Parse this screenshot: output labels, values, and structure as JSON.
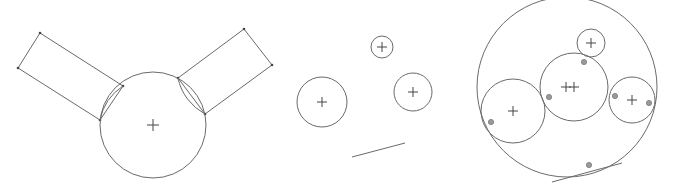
{
  "figure": {
    "width": 675,
    "height": 191,
    "background": "#ffffff",
    "stroke_color": "#6a6a6a",
    "marker_color": "#9a9a9a",
    "panels": [
      {
        "id": "panel-1",
        "description": "Circle with two attached rectangles",
        "circles": [
          {
            "cx": 153,
            "cy": 125,
            "r": 53,
            "center_cross": true
          }
        ],
        "polygons": [
          {
            "points": [
              [
                40,
                33
              ],
              [
                123,
                86
              ],
              [
                100,
                120
              ],
              [
                18,
                68
              ]
            ],
            "vertices_marked": true
          },
          {
            "points": [
              [
                244,
                29
              ],
              [
                272,
                65
              ],
              [
                205,
                114
              ],
              [
                178,
                78
              ]
            ],
            "vertices_marked": true
          }
        ],
        "arcs": [
          {
            "from": [
              123,
              86
            ],
            "to": [
              100,
              120
            ],
            "r": 53
          },
          {
            "from": [
              178,
              78
            ],
            "to": [
              205,
              114
            ],
            "r": 53
          }
        ]
      },
      {
        "id": "panel-2",
        "description": "Three separate circles and a line",
        "circles": [
          {
            "cx": 382,
            "cy": 47,
            "r": 11,
            "center_cross": true
          },
          {
            "cx": 322,
            "cy": 102,
            "r": 25,
            "center_cross": true
          },
          {
            "cx": 413,
            "cy": 92,
            "r": 19,
            "center_cross": true
          }
        ],
        "lines": [
          {
            "x1": 352,
            "y1": 157,
            "x2": 405,
            "y2": 143
          }
        ]
      },
      {
        "id": "panel-3",
        "description": "Enclosing circle tangent to inner circles and line, with tangency markers",
        "circles": [
          {
            "cx": 567,
            "cy": 87,
            "r": 90,
            "center_cross": false
          },
          {
            "cx": 591,
            "cy": 43,
            "r": 14,
            "center_cross": true
          },
          {
            "cx": 574,
            "cy": 87,
            "r": 34,
            "center_cross": true
          },
          {
            "cx": 513,
            "cy": 111,
            "r": 32,
            "center_cross": true
          },
          {
            "cx": 632,
            "cy": 100,
            "r": 23,
            "center_cross": true
          }
        ],
        "extra_crosses": [
          {
            "x": 566,
            "y": 87
          }
        ],
        "lines": [
          {
            "x1": 552,
            "y1": 182,
            "x2": 622,
            "y2": 163
          }
        ],
        "tangency_markers": [
          {
            "x": 584,
            "y": 62
          },
          {
            "x": 549,
            "y": 97
          },
          {
            "x": 491,
            "y": 122
          },
          {
            "x": 615,
            "y": 96
          },
          {
            "x": 649,
            "y": 103
          },
          {
            "x": 589,
            "y": 165
          }
        ]
      }
    ]
  }
}
